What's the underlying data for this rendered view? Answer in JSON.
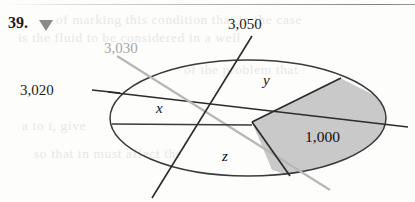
{
  "problem": {
    "number": "39.",
    "marker_icon": "triangle-down-icon"
  },
  "figure": {
    "type": "venn-ellipse-diagram",
    "shaded_region_color": "#c9c9c9",
    "outline_color": "#3a3a3a",
    "chord_labels": [
      {
        "id": "chord-3020",
        "text": "3,020",
        "color": "#1c1c1c",
        "style": "dark"
      },
      {
        "id": "chord-3030",
        "text": "3,030",
        "color": "#a8a6a4",
        "style": "faint"
      },
      {
        "id": "chord-3050",
        "text": "3,050",
        "color": "#1c1c1c",
        "style": "dark"
      }
    ],
    "region_labels": [
      {
        "id": "region-x",
        "text": "x"
      },
      {
        "id": "region-y",
        "text": "y"
      },
      {
        "id": "region-z",
        "text": "z"
      },
      {
        "id": "region-shaded",
        "text": "1,000"
      }
    ]
  },
  "background_bleed": [
    {
      "text": "of marking this condition that in the case",
      "x": 56,
      "y": 12
    },
    {
      "text": "is the fluid to be considered in a well",
      "x": 18,
      "y": 30
    },
    {
      "text": "of the problem that",
      "x": 184,
      "y": 62
    },
    {
      "text": "a to i, give",
      "x": 22,
      "y": 118
    },
    {
      "text": "so that in must affect the",
      "x": 34,
      "y": 146
    }
  ]
}
